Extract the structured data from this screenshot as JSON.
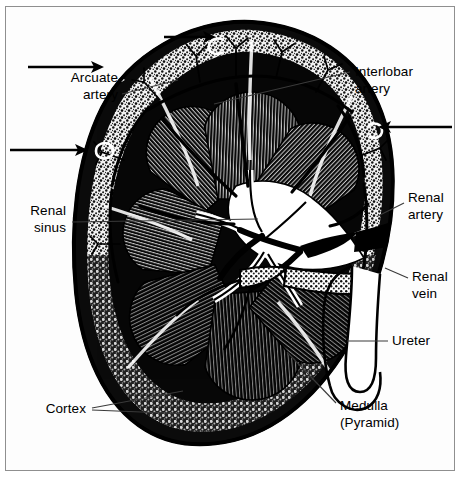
{
  "figure": {
    "view": "coronal-section",
    "style": "black-and-white engraving / halftone illustration",
    "frame_color": "#8f8f8f",
    "background_color": "#ffffff",
    "ink_color": "#000000"
  },
  "labels": [
    {
      "id": "arcuate-artery",
      "line1": "Arcuate",
      "line2": "artery",
      "align": "right",
      "text_x": 118,
      "text_y1": 82,
      "text_y2": 99,
      "leader": "M 122 94 L 178 80"
    },
    {
      "id": "interlobar-artery",
      "line1": "Interlobar",
      "line2": "artery",
      "align": "left",
      "text_x": 355,
      "text_y1": 76,
      "text_y2": 93,
      "leader": "M 350 72 L 214 104"
    },
    {
      "id": "renal-sinus",
      "line1": "Renal",
      "line2": "sinus",
      "align": "right",
      "text_x": 66,
      "text_y1": 215,
      "text_y2": 232,
      "leader": "M 72 222 L 258 219"
    },
    {
      "id": "renal-artery",
      "line1": "Renal",
      "line2": "artery",
      "align": "left",
      "text_x": 408,
      "text_y1": 202,
      "text_y2": 219,
      "leader": "M 404 203 L 378 216"
    },
    {
      "id": "renal-vein",
      "line1": "Renal",
      "line2": "vein",
      "align": "left",
      "text_x": 412,
      "text_y1": 281,
      "text_y2": 298,
      "leader": "M 408 278 L 385 268"
    },
    {
      "id": "ureter",
      "line1": "Ureter",
      "line2": "",
      "align": "left",
      "text_x": 392,
      "text_y1": 345,
      "text_y2": 0,
      "leader": "M 388 341 L 347 341"
    },
    {
      "id": "medulla-pyramid",
      "line1": "Medulla",
      "line2": "(Pyramid)",
      "align": "left",
      "text_x": 340,
      "text_y1": 410,
      "text_y2": 427,
      "leader": "M 336 403 L 287 352"
    },
    {
      "id": "cortex",
      "line1": "Cortex",
      "line2": "",
      "align": "right",
      "text_x": 86,
      "text_y1": 413,
      "text_y2": 0,
      "leader": "M 92 408 L 183 391",
      "leader2": "M 92 410 L 190 414"
    }
  ],
  "pointer_arrows": [
    {
      "id": "arrow-top-arcuate",
      "points_to": "arcuate artery at upper cortex",
      "shaft": "M 164 37 L 212 37",
      "head_x": 216,
      "head_y": 37,
      "direction": "right"
    },
    {
      "id": "arrow-upper-left",
      "points_to": "arcuate artery upper left",
      "shaft": "M 28 67 L 100 67",
      "head_x": 104,
      "head_y": 67,
      "direction": "right"
    },
    {
      "id": "arrow-mid-left",
      "points_to": "arcuate artery mid left",
      "shaft": "M 10 150 L 84 150",
      "head_x": 88,
      "head_y": 150,
      "direction": "right"
    },
    {
      "id": "arrow-mid-right",
      "points_to": "arcuate artery mid right",
      "shaft": "M 452 127 L 382 127",
      "head_x": 378,
      "head_y": 127,
      "direction": "left"
    }
  ],
  "anatomy": {
    "capsule": "dark outer capsule outline enclosing the bean-shaped organ",
    "cortex": "stippled granular outer zone beneath the capsule",
    "medulla_pyramids": "fan-shaped striated triangular pyramids radiating toward the sinus",
    "renal_sinus": "central open space containing vessels and collecting structures",
    "pyramid_count": 7,
    "hilum_side": "right"
  }
}
